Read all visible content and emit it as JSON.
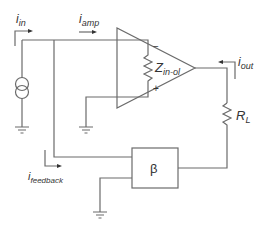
{
  "diagram": {
    "type": "circuit",
    "labels": {
      "i_in": {
        "main": "i",
        "sub": "in"
      },
      "i_amp": {
        "main": "i",
        "sub": "amp"
      },
      "i_out": {
        "main": "i",
        "sub": "out"
      },
      "i_feedback": {
        "main": "i",
        "sub": "feedback"
      },
      "z_in_ol": {
        "main": "Z",
        "sub": "in-ol"
      },
      "r_l": {
        "main": "R",
        "sub": "L"
      },
      "beta": "β",
      "minus": "−",
      "plus": "+"
    },
    "components": [
      "current-source",
      "op-amp",
      "input-impedance-z-in-ol",
      "load-resistor-r-l",
      "feedback-network-beta",
      "ground"
    ],
    "colors": {
      "wire": "#6b6b6b",
      "text": "#333333",
      "background": "#ffffff"
    }
  }
}
